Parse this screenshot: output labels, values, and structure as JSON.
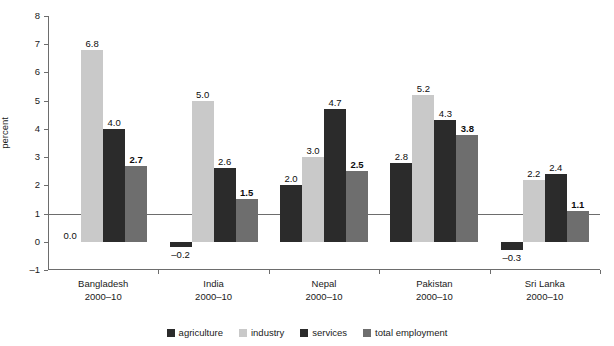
{
  "chart_data": {
    "type": "bar",
    "title": "",
    "xlabel": "",
    "ylabel": "percent",
    "ylim": [
      -1,
      8
    ],
    "yticks": [
      -1,
      0,
      1,
      2,
      3,
      4,
      5,
      6,
      7,
      8
    ],
    "ytick_labels": [
      "–1",
      "0",
      "1",
      "2",
      "3",
      "4",
      "5",
      "6",
      "7",
      "8"
    ],
    "grid": false,
    "legend_position": "bottom",
    "categories": [
      "Bangladesh",
      "India",
      "Nepal",
      "Pakistan",
      "Sri Lanka"
    ],
    "category_sublabels": [
      "2000–10",
      "2000–10",
      "2000–10",
      "2000–10",
      "2000–10"
    ],
    "series": [
      {
        "name": "agriculture",
        "color": "#2b2b2b",
        "values": [
          0.0,
          -0.2,
          2.0,
          2.8,
          -0.3
        ],
        "labels": [
          "0.0",
          "–0.2",
          "2.0",
          "2.8",
          "–0.3"
        ],
        "bold_labels": false
      },
      {
        "name": "industry",
        "color": "#c9c9c9",
        "values": [
          6.8,
          5.0,
          3.0,
          5.2,
          2.2
        ],
        "labels": [
          "6.8",
          "5.0",
          "3.0",
          "5.2",
          "2.2"
        ],
        "bold_labels": false
      },
      {
        "name": "services",
        "color": "#2b2b2b",
        "values": [
          4.0,
          2.6,
          4.7,
          4.3,
          2.4
        ],
        "labels": [
          "4.0",
          "2.6",
          "4.7",
          "4.3",
          "2.4"
        ],
        "bold_labels": false
      },
      {
        "name": "total employment",
        "color": "#6e6e6e",
        "values": [
          2.7,
          1.5,
          2.5,
          3.8,
          1.1
        ],
        "labels": [
          "2.7",
          "1.5",
          "2.5",
          "3.8",
          "1.1"
        ],
        "bold_labels": true
      }
    ]
  },
  "legend": {
    "items": [
      {
        "label": "agriculture",
        "color": "#2b2b2b"
      },
      {
        "label": "industry",
        "color": "#c9c9c9"
      },
      {
        "label": "services",
        "color": "#2b2b2b"
      },
      {
        "label": "total employment",
        "color": "#6e6e6e"
      }
    ]
  },
  "axis": {
    "y_title": "percent"
  }
}
